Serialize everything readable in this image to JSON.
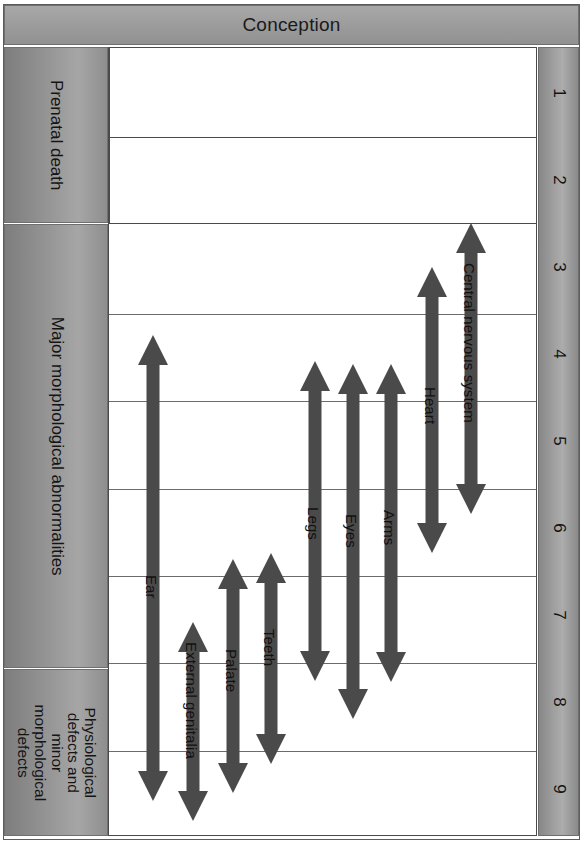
{
  "header": {
    "title": "Conception"
  },
  "categories": [
    {
      "id": "prenatal-death",
      "label": "Prenatal death"
    },
    {
      "id": "major-morphological-abnormalities",
      "label": "Major morphological abnormalities"
    },
    {
      "id": "physiological-defects",
      "label": "Physiological defects and minor morphological defects"
    }
  ],
  "week_axis": {
    "label": "weeks",
    "ticks": [
      "1",
      "2",
      "3",
      "4",
      "5",
      "6",
      "7",
      "8",
      "9"
    ]
  },
  "chart_data": {
    "type": "bar",
    "title": "Conception",
    "subtitle": "Critical periods of development by organ system",
    "xlabel": "",
    "ylabel": "Weeks from conception",
    "ylim": [
      0.5,
      9.5
    ],
    "grid": true,
    "legend_position": "none",
    "orientation": "vertical-timeline",
    "axis_direction": "top-to-bottom",
    "categories": [
      "Ear",
      "External genitalia",
      "Palate",
      "Teeth",
      "Legs",
      "Eyes",
      "Arms",
      "Heart",
      "Central nervous system"
    ],
    "series": [
      {
        "name": "Critical period (weeks from conception)",
        "ranges": [
          {
            "label": "Ear",
            "start_week": 3.7,
            "end_week": 9.2
          },
          {
            "label": "External genitalia",
            "start_week": 7.2,
            "end_week": 9.4
          },
          {
            "label": "Palate",
            "start_week": 6.6,
            "end_week": 8.8
          },
          {
            "label": "Teeth",
            "start_week": 6.6,
            "end_week": 8.2
          },
          {
            "label": "Legs",
            "start_week": 4.1,
            "end_week": 8.2
          },
          {
            "label": "Eyes",
            "start_week": 4.1,
            "end_week": 9.2
          },
          {
            "label": "Arms",
            "start_week": 4.1,
            "end_week": 8.2
          },
          {
            "label": "Heart",
            "start_week": 3.0,
            "end_week": 6.2
          },
          {
            "label": "Central nervous system",
            "start_week": 2.5,
            "end_week": 5.8
          }
        ]
      }
    ],
    "annotations": [
      {
        "text": "Prenatal death",
        "span_weeks": [
          1,
          2
        ]
      },
      {
        "text": "Major morphological abnormalities",
        "span_weeks": [
          3,
          7
        ]
      },
      {
        "text": "Physiological defects and minor morphological defects",
        "span_weeks": [
          7,
          9
        ]
      }
    ]
  },
  "arrows": [
    {
      "id": "ear",
      "label": "Ear",
      "x": 152,
      "top": 334,
      "bottom": 800,
      "label_offset": 240
    },
    {
      "id": "external-genitalia",
      "label": "External genitalia",
      "x": 192,
      "top": 621,
      "bottom": 820,
      "label_offset": 20
    },
    {
      "id": "palate",
      "label": "Palate",
      "x": 232,
      "top": 558,
      "bottom": 792,
      "label_offset": 90
    },
    {
      "id": "teeth",
      "label": "Teeth",
      "x": 270,
      "top": 552,
      "bottom": 763,
      "label_offset": 76
    },
    {
      "id": "legs",
      "label": "Legs",
      "x": 314,
      "top": 360,
      "bottom": 680,
      "label_offset": 146
    },
    {
      "id": "eyes",
      "label": "Eyes",
      "x": 352,
      "top": 363,
      "bottom": 718,
      "label_offset": 150
    },
    {
      "id": "arms",
      "label": "Arms",
      "x": 390,
      "top": 363,
      "bottom": 681,
      "label_offset": 146
    },
    {
      "id": "heart",
      "label": "Heart",
      "x": 431,
      "top": 266,
      "bottom": 552,
      "label_offset": 120
    },
    {
      "id": "central-nervous-system",
      "label": "Central nervous system",
      "x": 470,
      "top": 222,
      "bottom": 513,
      "label_offset": 40
    }
  ],
  "colors": {
    "arrow": "#4a4a4a",
    "band": "#9a9a9a",
    "grid": "#4a4a4a",
    "text": "#141414",
    "plot_background": "#ffffff"
  }
}
